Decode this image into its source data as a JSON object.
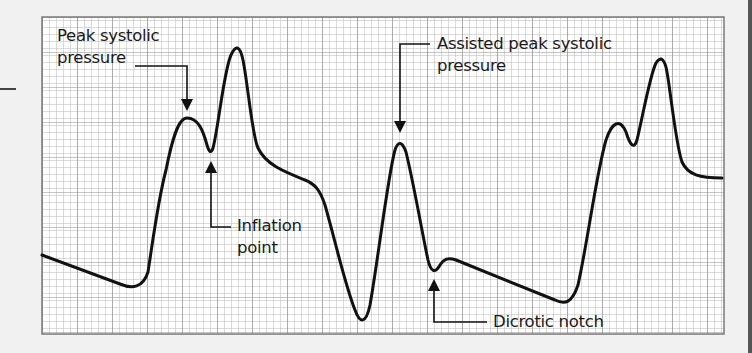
{
  "figure": {
    "type": "Intra-aortic balloon pump arterial pressure waveform",
    "background_color": "#f1f1f1",
    "grid": {
      "minor_spacing_px": 7,
      "major_every": 5,
      "minor_color": "#b5b5b5",
      "major_color": "#8c8c8c",
      "border_color": "#7a7a7a"
    },
    "waveform_color": "#111111"
  },
  "annotations": {
    "peak_systolic": {
      "line1": "Peak systolic",
      "line2": "pressure"
    },
    "inflation_point": {
      "line1": "Inflation",
      "line2": "point"
    },
    "assisted_peak": {
      "line1": "Assisted peak systolic",
      "line2": "pressure"
    },
    "dicrotic_notch": {
      "line1": "Dicrotic notch"
    }
  }
}
